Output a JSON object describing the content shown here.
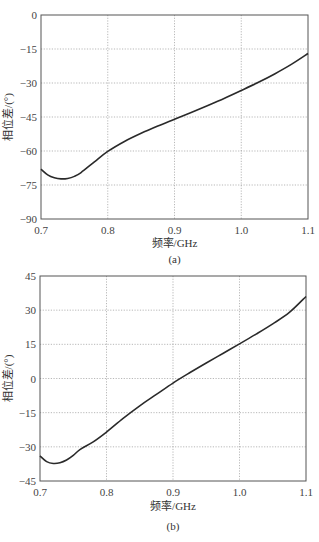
{
  "chart_data": [
    {
      "id": "a",
      "type": "line",
      "caption": "(a)",
      "title": "",
      "xlabel": "频率/GHz",
      "ylabel": "相位差/(°)",
      "xlim": [
        0.7,
        1.1
      ],
      "ylim": [
        -90,
        0
      ],
      "xticks": [
        0.7,
        0.8,
        0.9,
        1.0,
        1.1
      ],
      "xtick_labels": [
        "0.7",
        "0.8",
        "0.9",
        "1.0",
        "1.1"
      ],
      "yticks": [
        0,
        -15,
        -30,
        -45,
        -60,
        -75,
        -90
      ],
      "ytick_labels": [
        "0",
        "-15",
        "-30",
        "-45",
        "-60",
        "-75",
        "-90"
      ],
      "grid": true,
      "legend": null,
      "series": [
        {
          "name": "phase difference",
          "x": [
            0.7,
            0.71,
            0.72,
            0.73,
            0.74,
            0.75,
            0.76,
            0.78,
            0.8,
            0.825,
            0.85,
            0.875,
            0.9,
            0.925,
            0.95,
            0.975,
            1.0,
            1.025,
            1.05,
            1.075,
            1.1
          ],
          "y": [
            -68,
            -70.5,
            -71.8,
            -72.3,
            -72.1,
            -71.2,
            -69.5,
            -64.8,
            -60.2,
            -55.8,
            -52.2,
            -49.0,
            -46.0,
            -43.0,
            -39.9,
            -36.7,
            -33.3,
            -29.8,
            -26.0,
            -21.8,
            -17.0
          ]
        }
      ]
    },
    {
      "id": "b",
      "type": "line",
      "caption": "(b)",
      "title": "",
      "xlabel": "频率/GHz",
      "ylabel": "相位差/(°)",
      "xlim": [
        0.7,
        1.1
      ],
      "ylim": [
        -45,
        45
      ],
      "xticks": [
        0.7,
        0.8,
        0.9,
        1.0,
        1.1
      ],
      "xtick_labels": [
        "0.7",
        "0.8",
        "0.9",
        "1.0",
        "1.1"
      ],
      "yticks": [
        45,
        30,
        15,
        0,
        -15,
        -30,
        -45
      ],
      "ytick_labels": [
        "45",
        "30",
        "15",
        "0",
        "-15",
        "-30",
        "-45"
      ],
      "grid": true,
      "legend": null,
      "series": [
        {
          "name": "phase difference",
          "x": [
            0.7,
            0.71,
            0.72,
            0.73,
            0.74,
            0.75,
            0.76,
            0.78,
            0.8,
            0.825,
            0.85,
            0.875,
            0.9,
            0.925,
            0.95,
            0.975,
            1.0,
            1.025,
            1.05,
            1.075,
            1.1
          ],
          "y": [
            -34,
            -36.5,
            -37.3,
            -37.0,
            -35.8,
            -33.8,
            -31.2,
            -27.8,
            -23.5,
            -17.5,
            -12.0,
            -7.0,
            -2.0,
            2.5,
            6.8,
            11.0,
            15.2,
            19.5,
            24.0,
            29.0,
            36.0
          ]
        }
      ]
    }
  ],
  "figures": {
    "a": {
      "ylabel": "相位差/(°)",
      "xlabel": "频率/GHz",
      "caption": "(a)"
    },
    "b": {
      "ylabel": "相位差/(°)",
      "xlabel": "频率/GHz",
      "caption": "(b)"
    }
  }
}
